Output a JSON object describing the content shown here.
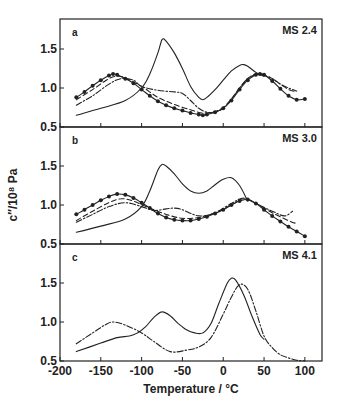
{
  "chart_data": {
    "type": "line",
    "xlabel": "Temperature / °C",
    "ylabel": "c″/10⁸ Pa",
    "xlim": [
      -200,
      121
    ],
    "x_ticks": [
      -200,
      -150,
      -100,
      -50,
      0,
      50,
      100
    ],
    "x_tick_labels": [
      "-200",
      "-150",
      "-100",
      "-50",
      "0",
      "50",
      "100"
    ],
    "grid": false,
    "legend": null,
    "panels": [
      {
        "letter": "a",
        "name": "MS 2.4",
        "ylim": [
          0.5,
          1.85
        ],
        "y_ticks": [
          0.5,
          1.0,
          1.5
        ],
        "y_tick_labels": [
          "0.5",
          "1.0",
          "1.5"
        ],
        "series": [
          {
            "name": "solid",
            "style": "solid",
            "markers": false,
            "x": [
              -180,
              -150,
              -120,
              -100,
              -90,
              -80,
              -75,
              -70,
              -60,
              -50,
              -40,
              -30,
              -25,
              -20,
              -10,
              0,
              10,
              20,
              25,
              30,
              40,
              50
            ],
            "y": [
              0.65,
              0.74,
              0.84,
              1.0,
              1.18,
              1.45,
              1.62,
              1.6,
              1.45,
              1.25,
              1.02,
              0.88,
              0.85,
              0.88,
              0.98,
              1.1,
              1.22,
              1.29,
              1.3,
              1.28,
              1.2,
              1.15
            ]
          },
          {
            "name": "circles",
            "style": "solid",
            "markers": true,
            "x": [
              -180,
              -170,
              -160,
              -150,
              -140,
              -135,
              -130,
              -120,
              -110,
              -100,
              -90,
              -80,
              -70,
              -60,
              -50,
              -40,
              -30,
              -25,
              -20,
              -10,
              0,
              10,
              20,
              30,
              40,
              45,
              50,
              60,
              70,
              80,
              90,
              100
            ],
            "y": [
              0.88,
              0.95,
              1.03,
              1.1,
              1.16,
              1.18,
              1.17,
              1.12,
              1.06,
              0.98,
              0.9,
              0.83,
              0.78,
              0.74,
              0.71,
              0.68,
              0.66,
              0.65,
              0.66,
              0.69,
              0.74,
              0.84,
              0.98,
              1.1,
              1.17,
              1.18,
              1.17,
              1.09,
              0.99,
              0.9,
              0.85,
              0.86
            ]
          },
          {
            "name": "dashed",
            "style": "dashed",
            "markers": false,
            "x": [
              -180,
              -160,
              -140,
              -130,
              -120,
              -100,
              -80,
              -60,
              -40,
              -25,
              -10,
              0,
              10,
              20,
              30,
              40,
              50,
              60,
              70,
              80,
              90
            ],
            "y": [
              0.85,
              0.98,
              1.12,
              1.15,
              1.13,
              1.02,
              0.88,
              0.79,
              0.72,
              0.68,
              0.7,
              0.75,
              0.86,
              1.0,
              1.12,
              1.18,
              1.17,
              1.12,
              1.05,
              0.98,
              0.95
            ]
          },
          {
            "name": "dash-dot",
            "style": "dashdot",
            "markers": false,
            "x": [
              -180,
              -160,
              -140,
              -125,
              -110,
              -100,
              -80,
              -60,
              -50,
              -40,
              -30,
              -20,
              -10,
              0,
              10,
              20,
              30,
              40,
              50,
              60,
              70,
              80,
              90
            ],
            "y": [
              0.78,
              0.9,
              1.05,
              1.12,
              1.1,
              1.02,
              0.97,
              0.95,
              0.93,
              0.84,
              0.74,
              0.69,
              0.69,
              0.74,
              0.85,
              1.0,
              1.12,
              1.17,
              1.16,
              1.12,
              1.05,
              1.0,
              0.96
            ]
          }
        ]
      },
      {
        "letter": "b",
        "name": "MS 3.0",
        "ylim": [
          0.5,
          1.85
        ],
        "y_ticks": [
          0.5,
          1.0,
          1.5
        ],
        "y_tick_labels": [
          "0.5",
          "1.0",
          "1.5"
        ],
        "series": [
          {
            "name": "solid",
            "style": "solid",
            "markers": false,
            "x": [
              -180,
              -150,
              -120,
              -100,
              -90,
              -80,
              -75,
              -70,
              -60,
              -50,
              -40,
              -30,
              -20,
              -10,
              0,
              10,
              20,
              30
            ],
            "y": [
              0.65,
              0.73,
              0.82,
              0.98,
              1.18,
              1.45,
              1.52,
              1.5,
              1.4,
              1.27,
              1.18,
              1.15,
              1.18,
              1.26,
              1.33,
              1.35,
              1.25,
              1.05
            ]
          },
          {
            "name": "circles",
            "style": "solid",
            "markers": true,
            "x": [
              -180,
              -170,
              -160,
              -150,
              -140,
              -130,
              -120,
              -110,
              -100,
              -90,
              -80,
              -70,
              -60,
              -50,
              -40,
              -30,
              -20,
              -10,
              0,
              10,
              20,
              30,
              40,
              50,
              60,
              70,
              80,
              90,
              100
            ],
            "y": [
              0.88,
              0.94,
              1.0,
              1.06,
              1.11,
              1.14,
              1.13,
              1.09,
              1.03,
              0.96,
              0.89,
              0.84,
              0.81,
              0.8,
              0.8,
              0.82,
              0.85,
              0.89,
              0.94,
              1.0,
              1.05,
              1.07,
              1.02,
              0.94,
              0.86,
              0.79,
              0.72,
              0.66,
              0.6
            ]
          },
          {
            "name": "dashed",
            "style": "dashed",
            "markers": false,
            "x": [
              -180,
              -160,
              -140,
              -125,
              -110,
              -90,
              -70,
              -50,
              -30,
              -10,
              10,
              25,
              40,
              60,
              80,
              90
            ],
            "y": [
              0.8,
              0.92,
              1.03,
              1.08,
              1.05,
              0.96,
              0.88,
              0.83,
              0.84,
              0.9,
              1.0,
              1.08,
              1.02,
              0.9,
              0.8,
              0.76
            ]
          },
          {
            "name": "dash-dot",
            "style": "dashdot",
            "markers": false,
            "x": [
              -180,
              -160,
              -140,
              -120,
              -100,
              -85,
              -70,
              -60,
              -50,
              -30,
              -10,
              10,
              25,
              40,
              60,
              75,
              85
            ],
            "y": [
              0.78,
              0.88,
              0.98,
              1.03,
              0.98,
              0.93,
              0.95,
              0.96,
              0.94,
              0.86,
              0.9,
              1.02,
              1.09,
              1.02,
              0.92,
              0.86,
              0.92
            ]
          }
        ]
      },
      {
        "letter": "c",
        "name": "MS 4.1",
        "ylim": [
          0.5,
          1.85
        ],
        "y_ticks": [
          0.5,
          1.0,
          1.5
        ],
        "y_tick_labels": [
          "0.5",
          "1.0",
          "1.5"
        ],
        "series": [
          {
            "name": "solid",
            "style": "solid",
            "markers": false,
            "x": [
              -180,
              -150,
              -130,
              -115,
              -105,
              -95,
              -85,
              -75,
              -65,
              -55,
              -45,
              -35,
              -25,
              -15,
              -5,
              5,
              10,
              15,
              25,
              35,
              45,
              50
            ],
            "y": [
              0.62,
              0.73,
              0.8,
              0.82,
              0.86,
              0.94,
              1.06,
              1.13,
              1.08,
              0.98,
              0.9,
              0.86,
              0.86,
              0.98,
              1.25,
              1.5,
              1.56,
              1.54,
              1.35,
              1.08,
              0.84,
              0.78
            ]
          },
          {
            "name": "dash-dot",
            "style": "dashdot",
            "markers": false,
            "x": [
              -180,
              -160,
              -145,
              -135,
              -120,
              -100,
              -85,
              -65,
              -45,
              -30,
              -15,
              0,
              10,
              20,
              30,
              40,
              50,
              60,
              70,
              80,
              90,
              100
            ],
            "y": [
              0.72,
              0.86,
              0.96,
              1.0,
              0.96,
              0.86,
              0.75,
              0.62,
              0.64,
              0.68,
              0.8,
              1.1,
              1.32,
              1.48,
              1.42,
              1.14,
              0.82,
              0.67,
              0.58,
              0.54,
              0.51,
              0.5
            ]
          }
        ]
      }
    ]
  }
}
